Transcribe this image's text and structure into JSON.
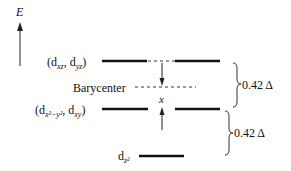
{
  "axis": {
    "label": "E"
  },
  "levels": {
    "top": {
      "label_prefix": "(d",
      "sub1": "xz",
      "mid": ", d",
      "sub2": "yz",
      "suffix": ")"
    },
    "barycenter": {
      "label": "Barycenter"
    },
    "middle": {
      "label_prefix": "(d",
      "sub1": "x²−y²",
      "mid": ", d",
      "sub2": "xy",
      "suffix": ")"
    },
    "bottom": {
      "label_prefix": "d",
      "sub1": "z²"
    }
  },
  "shift": {
    "label": "x"
  },
  "gaps": [
    {
      "label": "0.42 Δ"
    },
    {
      "label": "0.42 Δ"
    }
  ]
}
